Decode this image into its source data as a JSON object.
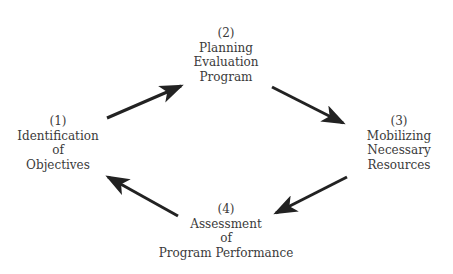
{
  "diagram": {
    "type": "cycle",
    "nodes": [
      {
        "id": "1",
        "number": "(1)",
        "lines": [
          "Identification",
          "of",
          "Objectives"
        ]
      },
      {
        "id": "2",
        "number": "(2)",
        "lines": [
          "Planning",
          "Evaluation",
          "Program"
        ]
      },
      {
        "id": "3",
        "number": "(3)",
        "lines": [
          "Mobilizing",
          "Necessary",
          "Resources"
        ]
      },
      {
        "id": "4",
        "number": "(4)",
        "lines": [
          "Assessment",
          "of",
          "Program Performance"
        ]
      }
    ],
    "edges": [
      {
        "from": "1",
        "to": "2"
      },
      {
        "from": "2",
        "to": "3"
      },
      {
        "from": "3",
        "to": "4"
      },
      {
        "from": "4",
        "to": "1"
      }
    ],
    "colors": {
      "text": "#3a3a3a",
      "arrow": "#222222",
      "background": "#ffffff"
    }
  }
}
